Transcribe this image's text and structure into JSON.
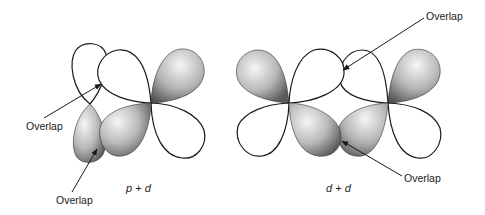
{
  "figure": {
    "panels": [
      {
        "id": "p_plus_d",
        "caption": "p + d",
        "description": "p orbital overlapping with d orbital",
        "labels": [
          {
            "text": "Overlap",
            "points_to": "upper p lobe / upper-left d lobe"
          },
          {
            "text": "Overlap",
            "points_to": "lower p lobe / lower-left d lobe"
          }
        ]
      },
      {
        "id": "d_plus_d",
        "caption": "d + d",
        "description": "d orbital overlapping with d orbital",
        "labels": [
          {
            "text": "Overlap",
            "points_to": "upper inner lobes"
          },
          {
            "text": "Overlap",
            "points_to": "lower inner lobes"
          }
        ]
      }
    ],
    "colors": {
      "outline": "#1a1a1a",
      "shade_light": "#f2f2f2",
      "shade_dark": "#6e6e6e",
      "background": "#ffffff"
    }
  }
}
